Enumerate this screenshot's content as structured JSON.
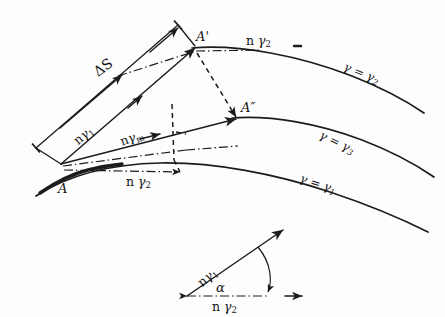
{
  "figure": {
    "background_color": "#fdfdfd",
    "ink_color": "#1c1c1c"
  },
  "points": {
    "origin": "A",
    "upper": "A'",
    "middle": "A″"
  },
  "vectors": {
    "delta_s": "ΔS",
    "n_gamma_1_head": "n",
    "n_gamma_1_sub": "γ",
    "n_gamma_1_idx": "1",
    "n_gamma_m_head": "n",
    "n_gamma_m_sub": "γ",
    "n_gamma_m_idx": "m",
    "n_gamma_2_head": "n",
    "n_gamma_2_sub": "γ",
    "n_gamma_2_idx": "2",
    "n_gamma_2_top_head": "n",
    "n_gamma_2_top_sub": "γ",
    "n_gamma_2_top_idx": "2"
  },
  "curves": {
    "top": {
      "lhs": "γ",
      "eq": "=",
      "rhs": "γ",
      "idx": "2"
    },
    "middle": {
      "lhs": "γ",
      "eq": "=",
      "rhs": "γ",
      "idx": "3"
    },
    "bottom": {
      "lhs": "γ",
      "eq": "=",
      "rhs": "γ",
      "idx": "1"
    }
  },
  "inset": {
    "angle": "α",
    "vector_a_head": "n",
    "vector_a_sub": "γ",
    "vector_a_idx": "1",
    "vector_b_head": "n",
    "vector_b_sub": "γ",
    "vector_b_idx": "2"
  }
}
